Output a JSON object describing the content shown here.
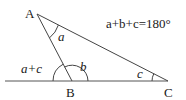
{
  "diagram": {
    "type": "geometry-triangle",
    "points": {
      "A": {
        "label": "A",
        "x": 37,
        "y": 14
      },
      "B": {
        "label": "B",
        "x": 72,
        "y": 81
      },
      "C": {
        "label": "C",
        "x": 168,
        "y": 81
      }
    },
    "angles": {
      "a": {
        "label": "a",
        "vertex": "A"
      },
      "b": {
        "label": "b",
        "vertex": "B"
      },
      "c": {
        "label": "c",
        "vertex": "C"
      },
      "exterior": {
        "label": "a+c",
        "vertex": "B"
      }
    },
    "equation": "a+b+c=180°",
    "colors": {
      "line": "#333333",
      "text": "#1a1a1a"
    }
  }
}
